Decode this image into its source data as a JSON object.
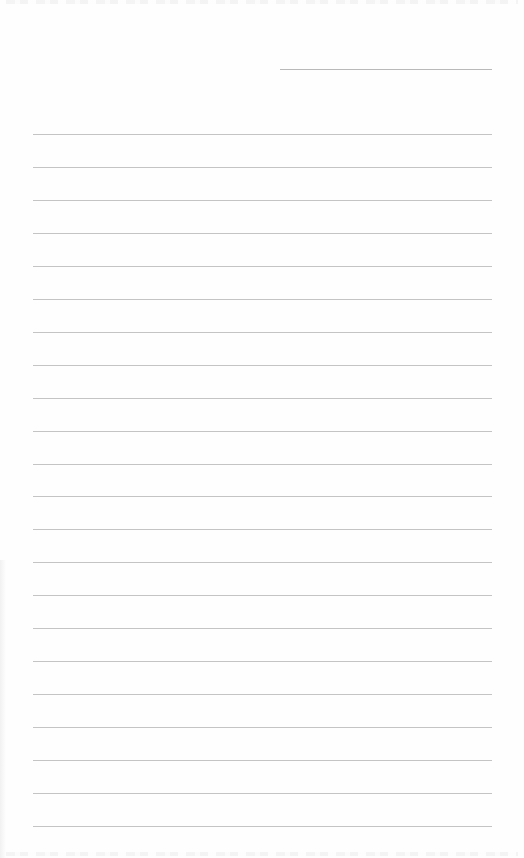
{
  "document": {
    "type": "lined writing sheet",
    "header": {
      "date_field": {
        "label": "",
        "value": ""
      }
    },
    "ruled_lines": {
      "count": 22,
      "entries": [
        "",
        "",
        "",
        "",
        "",
        "",
        "",
        "",
        "",
        "",
        "",
        "",
        "",
        "",
        "",
        "",
        "",
        "",
        "",
        "",
        "",
        ""
      ]
    },
    "colors": {
      "paper": "#fefefe",
      "rule": "#c4c4c4",
      "date_rule": "#b9b9b9"
    }
  }
}
